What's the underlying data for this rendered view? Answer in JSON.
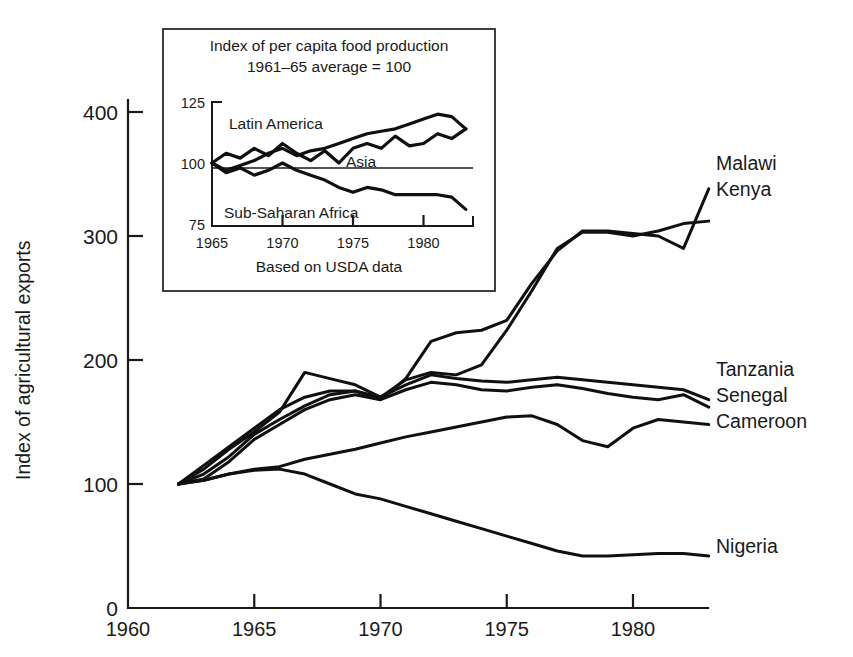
{
  "chart_data": {
    "type": "line",
    "title": "",
    "xlabel": "",
    "ylabel": "Index of agricultural exports",
    "xlim": [
      1960,
      1983
    ],
    "ylim": [
      0,
      430
    ],
    "xticks": [
      "1960",
      "1965",
      "1970",
      "1975",
      "1980"
    ],
    "xtick_values": [
      1960,
      1965,
      1970,
      1975,
      1980
    ],
    "yticks": [
      "0",
      "100",
      "200",
      "300",
      "400"
    ],
    "ytick_values": [
      0,
      100,
      200,
      300,
      400
    ],
    "grid": false,
    "legend_position": "right-of-plot",
    "series": [
      {
        "name": "Malawi",
        "label": "Malawi",
        "x": [
          1962,
          1963,
          1964,
          1965,
          1966,
          1967,
          1968,
          1969,
          1970,
          1971,
          1972,
          1973,
          1974,
          1975,
          1976,
          1977,
          1978,
          1979,
          1980,
          1981,
          1982,
          1983
        ],
        "values": [
          100,
          115,
          130,
          145,
          160,
          170,
          175,
          175,
          168,
          185,
          215,
          222,
          224,
          232,
          262,
          288,
          304,
          304,
          302,
          300,
          290,
          338
        ]
      },
      {
        "name": "Kenya",
        "label": "Kenya",
        "x": [
          1962,
          1963,
          1964,
          1965,
          1966,
          1967,
          1968,
          1969,
          1970,
          1971,
          1972,
          1973,
          1974,
          1975,
          1976,
          1977,
          1978,
          1979,
          1980,
          1981,
          1982,
          1983
        ],
        "values": [
          100,
          112,
          128,
          142,
          158,
          190,
          185,
          180,
          170,
          184,
          190,
          188,
          196,
          224,
          256,
          290,
          303,
          303,
          300,
          304,
          310,
          312
        ]
      },
      {
        "name": "Tanzania",
        "label": "Tanzania",
        "x": [
          1962,
          1963,
          1964,
          1965,
          1966,
          1967,
          1968,
          1969,
          1970,
          1971,
          1972,
          1973,
          1974,
          1975,
          1976,
          1977,
          1978,
          1979,
          1980,
          1981,
          1982,
          1983
        ],
        "values": [
          100,
          108,
          122,
          140,
          152,
          163,
          172,
          175,
          170,
          180,
          188,
          185,
          183,
          182,
          184,
          186,
          184,
          182,
          180,
          178,
          176,
          168
        ]
      },
      {
        "name": "Senegal",
        "label": "Senegal",
        "x": [
          1962,
          1963,
          1964,
          1965,
          1966,
          1967,
          1968,
          1969,
          1970,
          1971,
          1972,
          1973,
          1974,
          1975,
          1976,
          1977,
          1978,
          1979,
          1980,
          1981,
          1982,
          1983
        ],
        "values": [
          100,
          104,
          118,
          136,
          148,
          160,
          168,
          172,
          168,
          176,
          182,
          180,
          176,
          175,
          178,
          180,
          177,
          173,
          170,
          168,
          172,
          162
        ]
      },
      {
        "name": "Cameroon",
        "label": "Cameroon",
        "x": [
          1962,
          1963,
          1964,
          1965,
          1966,
          1967,
          1968,
          1969,
          1970,
          1971,
          1972,
          1973,
          1974,
          1975,
          1976,
          1977,
          1978,
          1979,
          1980,
          1981,
          1982,
          1983
        ],
        "values": [
          100,
          103,
          108,
          112,
          114,
          120,
          124,
          128,
          133,
          138,
          142,
          146,
          150,
          154,
          155,
          148,
          135,
          130,
          145,
          152,
          150,
          148
        ]
      },
      {
        "name": "Nigeria",
        "label": "Nigeria",
        "x": [
          1962,
          1963,
          1964,
          1965,
          1966,
          1967,
          1968,
          1969,
          1970,
          1971,
          1972,
          1973,
          1974,
          1975,
          1976,
          1977,
          1978,
          1979,
          1980,
          1981,
          1982,
          1983
        ],
        "values": [
          100,
          103,
          108,
          111,
          112,
          108,
          100,
          92,
          88,
          82,
          76,
          70,
          64,
          58,
          52,
          46,
          42,
          42,
          43,
          44,
          44,
          42
        ]
      }
    ],
    "series_label_groups": [
      {
        "labels": [
          "Malawi",
          "Kenya"
        ],
        "y_anchor": 170
      },
      {
        "labels": [
          "Tanzania",
          "Senegal",
          "Cameroon"
        ],
        "y_anchor": 376
      },
      {
        "labels": [
          "Nigeria"
        ],
        "y_anchor": 553
      }
    ]
  },
  "inset_chart_data": {
    "type": "line",
    "title_line1": "Index of per capita food production",
    "title_line2": "1961–65 average = 100",
    "caption": "Based on USDA data",
    "xlim": [
      1965,
      1983
    ],
    "ylim": [
      75,
      125
    ],
    "xticks": [
      "1965",
      "1970",
      "1975",
      "1980"
    ],
    "xtick_values": [
      1965,
      1970,
      1975,
      1980
    ],
    "yticks": [
      "125",
      "100",
      "75"
    ],
    "ytick_values": [
      125,
      100,
      75
    ],
    "reference_line": 100,
    "grid": false,
    "series": [
      {
        "name": "Latin America",
        "label": "Latin America",
        "x": [
          1965,
          1966,
          1967,
          1968,
          1969,
          1970,
          1971,
          1972,
          1973,
          1974,
          1975,
          1976,
          1977,
          1978,
          1979,
          1980,
          1981,
          1982,
          1983
        ],
        "values": [
          100,
          97,
          99,
          101,
          104,
          106,
          103,
          105,
          106,
          108,
          110,
          112,
          113,
          114,
          116,
          118,
          120,
          119,
          114
        ]
      },
      {
        "name": "Asia",
        "label": "Asia",
        "x": [
          1965,
          1966,
          1967,
          1968,
          1969,
          1970,
          1971,
          1972,
          1973,
          1974,
          1975,
          1976,
          1977,
          1978,
          1979,
          1980,
          1981,
          1982,
          1983
        ],
        "values": [
          100,
          104,
          102,
          106,
          103,
          108,
          104,
          101,
          105,
          100,
          106,
          108,
          106,
          111,
          107,
          108,
          112,
          110,
          114
        ]
      },
      {
        "name": "Sub-Saharan Africa",
        "label": "Sub-Saharan Africa",
        "x": [
          1965,
          1966,
          1967,
          1968,
          1969,
          1970,
          1971,
          1972,
          1973,
          1974,
          1975,
          1976,
          1977,
          1978,
          1979,
          1980,
          1981,
          1982,
          1983
        ],
        "values": [
          100,
          96,
          98,
          95,
          97,
          100,
          97,
          95,
          93,
          90,
          88,
          90,
          89,
          87,
          87,
          87,
          87,
          86,
          81
        ]
      }
    ]
  }
}
